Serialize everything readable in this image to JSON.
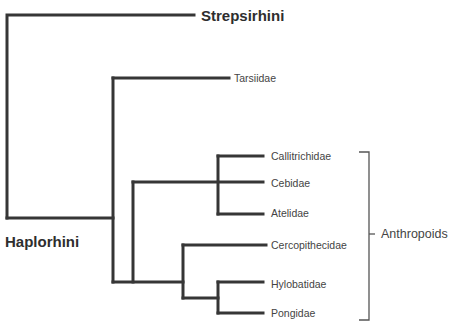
{
  "diagram": {
    "type": "phylogenetic-tree",
    "colors": {
      "branch": "#363636",
      "bracket": "#555555",
      "text": "#3a3a3a"
    },
    "branch_width": 3,
    "branches": [
      {
        "name": "root-stem",
        "points": [
          [
            7,
            218
          ],
          [
            7,
            15
          ],
          [
            194,
            15
          ]
        ]
      },
      {
        "name": "haplorhini-stem",
        "points": [
          [
            7,
            218
          ],
          [
            113,
            218
          ]
        ]
      },
      {
        "name": "haplorhini-node",
        "points": [
          [
            113,
            78
          ],
          [
            113,
            282
          ]
        ]
      },
      {
        "name": "tarsiidae-branch",
        "points": [
          [
            113,
            78
          ],
          [
            229,
            78
          ]
        ]
      },
      {
        "name": "anthropoid-stem",
        "points": [
          [
            113,
            282
          ],
          [
            183,
            282
          ]
        ]
      },
      {
        "name": "platyrrhini-stem",
        "points": [
          [
            133,
            282
          ],
          [
            133,
            182
          ]
        ]
      },
      {
        "name": "cebidae-branch",
        "points": [
          [
            133,
            182
          ],
          [
            263,
            182
          ]
        ]
      },
      {
        "name": "platyrrhini-node",
        "points": [
          [
            218,
            156
          ],
          [
            218,
            214
          ]
        ]
      },
      {
        "name": "callitrichidae-branch",
        "points": [
          [
            218,
            156
          ],
          [
            263,
            156
          ]
        ]
      },
      {
        "name": "atelidae-branch",
        "points": [
          [
            218,
            214
          ],
          [
            263,
            214
          ]
        ]
      },
      {
        "name": "catarrhini-node",
        "points": [
          [
            183,
            245
          ],
          [
            183,
            298
          ]
        ]
      },
      {
        "name": "cercopithecidae-branch",
        "points": [
          [
            183,
            245
          ],
          [
            266,
            245
          ]
        ]
      },
      {
        "name": "hominoid-stem",
        "points": [
          [
            183,
            298
          ],
          [
            218,
            298
          ]
        ]
      },
      {
        "name": "hominoid-node",
        "points": [
          [
            218,
            282
          ],
          [
            218,
            313
          ]
        ]
      },
      {
        "name": "hylobatidae-branch",
        "points": [
          [
            218,
            282
          ],
          [
            263,
            282
          ]
        ]
      },
      {
        "name": "pongidae-branch",
        "points": [
          [
            218,
            313
          ],
          [
            263,
            313
          ]
        ]
      }
    ],
    "bracket": {
      "name": "anthropoids-bracket",
      "points": [
        [
          359,
          152
        ],
        [
          369,
          152
        ],
        [
          369,
          320
        ],
        [
          359,
          320
        ]
      ],
      "tick": [
        [
          369,
          234
        ],
        [
          375,
          234
        ]
      ]
    },
    "labels": [
      {
        "id": "strepsirhini",
        "text": "Strepsirhini",
        "x": 201,
        "y": 15,
        "style": "major"
      },
      {
        "id": "haplorhini",
        "text": "Haplorhini",
        "x": 5,
        "y": 241,
        "style": "major"
      },
      {
        "id": "tarsiidae",
        "text": "Tarsiidae",
        "x": 234,
        "y": 78,
        "style": "taxon"
      },
      {
        "id": "callitrichidae",
        "text": "Callitrichidae",
        "x": 271,
        "y": 156,
        "style": "taxon"
      },
      {
        "id": "cebidae",
        "text": "Cebidae",
        "x": 271,
        "y": 183,
        "style": "taxon"
      },
      {
        "id": "atelidae",
        "text": "Atelidae",
        "x": 271,
        "y": 213,
        "style": "taxon"
      },
      {
        "id": "cercopithecidae",
        "text": "Cercopithecidae",
        "x": 271,
        "y": 245,
        "style": "taxon"
      },
      {
        "id": "hylobatidae",
        "text": "Hylobatidae",
        "x": 271,
        "y": 284,
        "style": "taxon"
      },
      {
        "id": "pongidae",
        "text": "Pongidae",
        "x": 271,
        "y": 313,
        "style": "taxon"
      },
      {
        "id": "anthropoids",
        "text": "Anthropoids",
        "x": 381,
        "y": 234,
        "style": "group"
      }
    ]
  }
}
